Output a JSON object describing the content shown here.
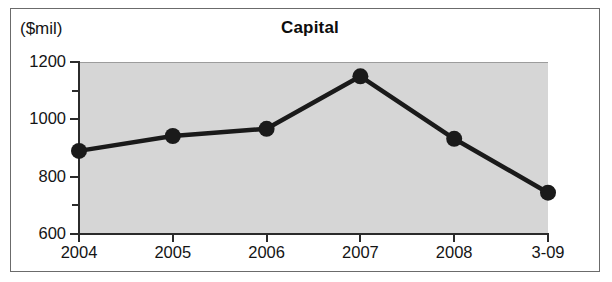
{
  "figure": {
    "unit_label": "($mil)",
    "title": "Capital",
    "frame_color": "#6b6b6b",
    "plot_background_color": "#d6d6d6",
    "series_color": "#1a1a1a",
    "text_color": "#141414"
  },
  "chart_data": {
    "type": "line",
    "title": "Capital",
    "subtitle": "",
    "xlabel": "",
    "ylabel": "($mil)",
    "categories": [
      "2004",
      "2005",
      "2006",
      "2007",
      "2008",
      "3-09"
    ],
    "values": [
      890,
      942,
      967,
      1150,
      932,
      744
    ],
    "series": [
      {
        "name": "Capital",
        "values": [
          890,
          942,
          967,
          1150,
          932,
          744
        ]
      }
    ],
    "ylim": [
      600,
      1200
    ],
    "ytick_labels": [
      "600",
      "800",
      "1000",
      "1200"
    ],
    "ytick_values": [
      600,
      800,
      1000,
      1200
    ],
    "yminor_tick_values": [
      700,
      900,
      1100
    ],
    "grid": false,
    "legend": "none",
    "markers": "filled-circle",
    "units": "$ millions"
  }
}
